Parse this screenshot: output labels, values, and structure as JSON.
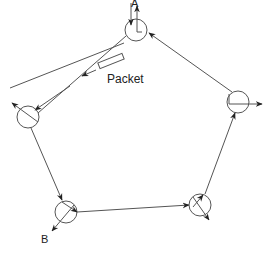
{
  "diagram": {
    "type": "token-ring",
    "labels": {
      "node_a": "A",
      "node_b": "B",
      "packet": "Packet"
    },
    "nodes": [
      {
        "id": "A",
        "cx": 136,
        "cy": 30,
        "r": 11
      },
      {
        "id": "left",
        "cx": 28,
        "cy": 117,
        "r": 11
      },
      {
        "id": "B",
        "cx": 66,
        "cy": 212,
        "r": 11
      },
      {
        "id": "bottom-right",
        "cx": 200,
        "cy": 205,
        "r": 11
      },
      {
        "id": "right",
        "cx": 238,
        "cy": 102,
        "r": 11
      }
    ],
    "colors": {
      "line": "#444444",
      "text": "#222222"
    }
  }
}
